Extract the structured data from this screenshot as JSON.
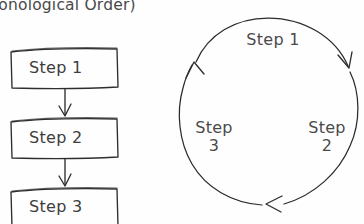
{
  "page": {
    "title_partial": "hronological Order)",
    "background_color": "#fefefe",
    "ink_color": "#2e2e2e",
    "text_color": "#4a4a4a",
    "width": 364,
    "height": 224
  },
  "flowchart": {
    "name": "linear-sequence-flowchart",
    "orientation": "vertical",
    "boxes": [
      {
        "label": "Step 1"
      },
      {
        "label": "Step 2"
      },
      {
        "label": "Step 3"
      }
    ],
    "connectors": [
      {
        "from": "Step 1",
        "to": "Step 2",
        "arrow": "down"
      },
      {
        "from": "Step 2",
        "to": "Step 3",
        "arrow": "down"
      }
    ]
  },
  "cycle": {
    "name": "circular-cycle-diagram",
    "direction": "clockwise",
    "arrow_count": 3,
    "labels": [
      {
        "line1": "Step 1",
        "line2": "",
        "position": "top"
      },
      {
        "line1": "Step",
        "line2": "2",
        "position": "right"
      },
      {
        "line1": "Step",
        "line2": "3",
        "position": "left"
      }
    ]
  }
}
